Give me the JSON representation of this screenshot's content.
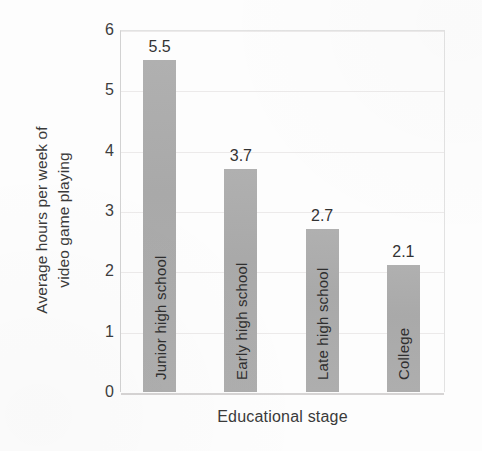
{
  "chart_data": {
    "type": "bar",
    "title": "",
    "categories": [
      "Junior high school",
      "Early high school",
      "Late high school",
      "College"
    ],
    "values": [
      5.5,
      3.7,
      2.7,
      2.1
    ],
    "value_labels": [
      "5.5",
      "3.7",
      "2.7",
      "2.1"
    ],
    "xlabel": "Educational stage",
    "ylabel": "Average hours per week of video game playing",
    "ylabel_lines": [
      "Average hours per week of",
      "video game playing"
    ],
    "ylim": [
      0,
      6
    ],
    "yticks": [
      0,
      1,
      2,
      3,
      4,
      5,
      6
    ],
    "ytick_labels": [
      "0",
      "1",
      "2",
      "3",
      "4",
      "5",
      "6"
    ],
    "grid": true,
    "grid_axis": "y",
    "legend": false,
    "bar_color": "#adadad",
    "category_label_position": "inside-bar-rotated",
    "value_label_position": "above-bar",
    "background_color": "#fdfdfd",
    "text_color": "#333333"
  }
}
